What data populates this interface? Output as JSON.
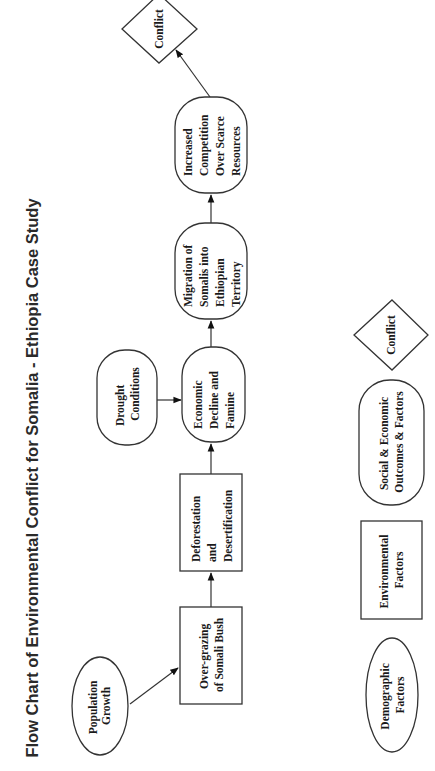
{
  "title": "Flow Chart of Environmental Conflict for Somalia - Ethiopia Case Study",
  "colors": {
    "background": "#ffffff",
    "stroke": "#333333",
    "text": "#1a1a1a"
  },
  "nodes": {
    "population_growth": {
      "lines": [
        "Population",
        "Growth"
      ],
      "type": "Demographic Factors",
      "shape": "ellipse"
    },
    "over_grazing": {
      "lines": [
        "Over-grazing",
        "of Somali Bush"
      ],
      "type": "Environmental Factors",
      "shape": "rectangle"
    },
    "deforestation": {
      "lines": [
        "Deforestation",
        "and",
        "Desertification"
      ],
      "type": "Environmental Factors",
      "shape": "rectangle"
    },
    "drought": {
      "lines": [
        "Drought",
        "Conditions"
      ],
      "type": "Social & Economic Outcomes & Factors",
      "shape": "rounded-rectangle"
    },
    "economic_decline": {
      "lines": [
        "Economic",
        "Decline and",
        "Famine"
      ],
      "type": "Social & Economic Outcomes & Factors",
      "shape": "rounded-rectangle"
    },
    "migration": {
      "lines": [
        "Migration of",
        "Somalis into",
        "Ethiopian",
        "Territory"
      ],
      "type": "Social & Economic Outcomes & Factors",
      "shape": "rounded-rectangle"
    },
    "competition": {
      "lines": [
        "Increased",
        "Competition",
        "Over Scarce",
        "Resources"
      ],
      "type": "Social & Economic Outcomes & Factors",
      "shape": "rounded-rectangle"
    },
    "conflict": {
      "lines": [
        "Conflict"
      ],
      "type": "Conflict",
      "shape": "diamond"
    }
  },
  "edges": [
    {
      "from": "Population Growth",
      "to": "Over-grazing of Somali Bush"
    },
    {
      "from": "Over-grazing of Somali Bush",
      "to": "Deforestation and Desertification"
    },
    {
      "from": "Deforestation and Desertification",
      "to": "Economic Decline and Famine"
    },
    {
      "from": "Drought Conditions",
      "to": "Economic Decline and Famine"
    },
    {
      "from": "Economic Decline and Famine",
      "to": "Migration of Somalis into Ethiopian Territory"
    },
    {
      "from": "Migration of Somalis into Ethiopian Territory",
      "to": "Increased Competition Over Scarce Resources"
    },
    {
      "from": "Increased Competition Over Scarce Resources",
      "to": "Conflict"
    }
  ],
  "legend": {
    "demographic": {
      "lines": [
        "Demographic",
        "Factors"
      ],
      "shape": "ellipse"
    },
    "environmental": {
      "lines": [
        "Environmental",
        "Factors"
      ],
      "shape": "rectangle"
    },
    "social_economic": {
      "lines": [
        "Social & Economic",
        "Outcomes & Factors"
      ],
      "shape": "rounded-rectangle"
    },
    "conflict": {
      "lines": [
        "Conflict"
      ],
      "shape": "diamond"
    }
  },
  "orientation": "rotated 90° counter-clockwise"
}
